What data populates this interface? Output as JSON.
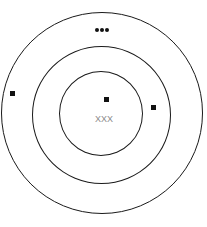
{
  "diagram": {
    "type": "concentric-circles",
    "rings": [
      {
        "name": "outer",
        "cx": 102,
        "cy": 113,
        "r": 101
      },
      {
        "name": "middle",
        "cx": 101,
        "cy": 115,
        "r": 69
      },
      {
        "name": "inner",
        "cx": 101,
        "cy": 113,
        "r": 42
      }
    ],
    "markers": [
      {
        "name": "top-dots",
        "glyph": "•••",
        "x": 102,
        "y": 30
      },
      {
        "name": "left-square",
        "glyph": "■",
        "x": 12,
        "y": 93
      },
      {
        "name": "center-square",
        "glyph": "■",
        "x": 107,
        "y": 99
      },
      {
        "name": "right-square",
        "glyph": "■",
        "x": 154,
        "y": 107
      }
    ],
    "center_label": "XXX",
    "colors": {
      "stroke": "#1a1a1a",
      "marker": "#111111",
      "label": "#8a8a8a",
      "background": "#ffffff"
    }
  }
}
